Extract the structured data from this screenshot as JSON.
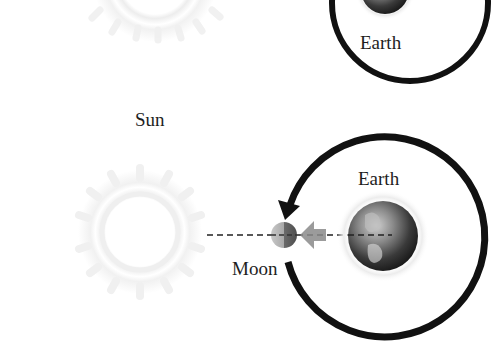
{
  "diagram": {
    "type": "orbital-alignment",
    "labels": {
      "sun": "Sun",
      "earth_top": "Earth",
      "earth_bottom": "Earth",
      "moon": "Moon"
    },
    "colors": {
      "orbit_stroke": "#111111",
      "sun_glow": "#eeeeee",
      "earth_dark": "#2a2a2a",
      "earth_light": "#9a9a9a",
      "moon_light": "#bdbdbd",
      "moon_dark": "#6a6a6a",
      "pull_arrow": "#8a8a8a",
      "dash_line": "#222222",
      "text": "#1e1e1e"
    },
    "panels": [
      {
        "name": "top",
        "objects": [
          "Sun (faint)",
          "Earth",
          "orbit"
        ]
      },
      {
        "name": "bottom",
        "objects": [
          "Sun (faint)",
          "Earth",
          "Moon",
          "orbit",
          "gravity-arrow",
          "alignment-line"
        ]
      }
    ]
  }
}
